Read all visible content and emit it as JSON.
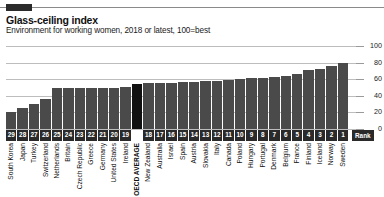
{
  "header": {
    "brand_block": "brand-marker",
    "title": "Glass-ceiling index",
    "subtitle": "Environment for working women, 2018 or latest, 100=best"
  },
  "axis": {
    "rank_label": "Rank",
    "yticks": [
      "100",
      "80",
      "60",
      "40",
      "20",
      "0"
    ]
  },
  "chart_data": {
    "type": "bar",
    "title": "Glass-ceiling index",
    "subtitle": "Environment for working women, 2018 or latest, 100=best",
    "xlabel": "",
    "ylabel": "",
    "ylim": [
      0,
      100
    ],
    "yticks": [
      0,
      20,
      40,
      60,
      80,
      100
    ],
    "grid": true,
    "legend": false,
    "orientation": "vertical",
    "series_name": "Glass-ceiling index score",
    "highlight_category": "OECD AVERAGE",
    "colors": {
      "bar": "#4a4a4a",
      "highlight": "#111111",
      "grid": "#bdbdbd",
      "rank_chip": "#2a2a2a"
    },
    "categories": [
      "South Korea",
      "Japan",
      "Turkey",
      "Switzerland",
      "Netherlands",
      "Britain",
      "Czech Republic",
      "Greece",
      "Germany",
      "United States",
      "Ireland",
      "OECD AVERAGE",
      "New Zealand",
      "Australia",
      "Israel",
      "Spain",
      "Austria",
      "Slovakia",
      "Italy",
      "Canada",
      "Poland",
      "Hungary",
      "Portugal",
      "Denmark",
      "Belgium",
      "France",
      "Finland",
      "Iceland",
      "Norway",
      "Sweden"
    ],
    "ranks": [
      "29",
      "28",
      "27",
      "26",
      "25",
      "24",
      "23",
      "22",
      "21",
      "20",
      "19",
      "",
      "18",
      "17",
      "16",
      "15",
      "14",
      "13",
      "12",
      "11",
      "10",
      "9",
      "8",
      "7",
      "6",
      "5",
      "4",
      "3",
      "2",
      "1"
    ],
    "values": [
      20,
      25,
      30,
      36,
      49,
      49,
      49,
      49,
      49,
      50,
      51,
      54,
      55,
      56,
      56,
      57,
      57,
      58,
      58,
      59,
      60,
      61,
      62,
      63,
      64,
      66,
      71,
      72,
      76,
      79
    ]
  }
}
